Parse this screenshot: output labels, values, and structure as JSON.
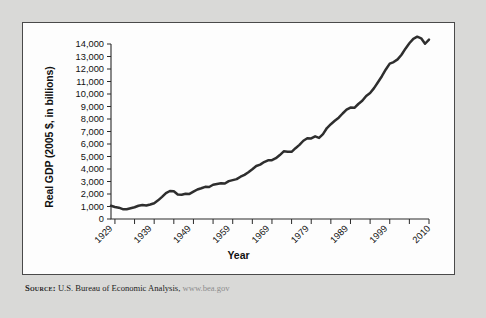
{
  "figure": {
    "source_prefix": "Source:",
    "source_text": "U.S. Bureau of Economic Analysis,",
    "source_url": "www.bea.gov"
  },
  "chart_data": {
    "type": "line",
    "title": "",
    "xlabel": "Year",
    "ylabel": "Real GDP (2005 $, in billions)",
    "xlim": [
      1929,
      2010
    ],
    "ylim": [
      0,
      14000
    ],
    "grid": false,
    "legend": "none",
    "x_tick_interval": 5,
    "x_labeled_ticks": [
      "1929",
      "1939",
      "1949",
      "1959",
      "1969",
      "1979",
      "1989",
      "1999",
      "2010"
    ],
    "y_tick_labels": [
      "0",
      "1,000",
      "2,000",
      "3,000",
      "4,000",
      "5,000",
      "6,000",
      "7,000",
      "8,000",
      "9,000",
      "10,000",
      "11,000",
      "12,000",
      "13,000",
      "14,000"
    ],
    "y_tick_values": [
      0,
      1000,
      2000,
      3000,
      4000,
      5000,
      6000,
      7000,
      8000,
      9000,
      10000,
      11000,
      12000,
      13000,
      14000
    ],
    "line_color": "#2e2e2e",
    "series": [
      {
        "name": "Real GDP (2005 $, in billions)",
        "x": [
          1929,
          1930,
          1931,
          1932,
          1933,
          1934,
          1935,
          1936,
          1937,
          1938,
          1939,
          1940,
          1941,
          1942,
          1943,
          1944,
          1945,
          1946,
          1947,
          1948,
          1949,
          1950,
          1951,
          1952,
          1953,
          1954,
          1955,
          1956,
          1957,
          1958,
          1959,
          1960,
          1961,
          1962,
          1963,
          1964,
          1965,
          1966,
          1967,
          1968,
          1969,
          1970,
          1971,
          1972,
          1973,
          1974,
          1975,
          1976,
          1977,
          1978,
          1979,
          1980,
          1981,
          1982,
          1983,
          1984,
          1985,
          1986,
          1987,
          1988,
          1989,
          1990,
          1991,
          1992,
          1993,
          1994,
          1995,
          1996,
          1997,
          1998,
          1999,
          2000,
          2001,
          2002,
          2003,
          2004,
          2005,
          2006,
          2007,
          2008,
          2009,
          2010
        ],
        "values": [
          1057,
          966,
          904,
          787,
          777,
          861,
          938,
          1059,
          1114,
          1075,
          1163,
          1264,
          1491,
          1772,
          2074,
          2240,
          2218,
          1961,
          1940,
          2020,
          2009,
          2184,
          2361,
          2457,
          2572,
          2557,
          2739,
          2797,
          2856,
          2835,
          3031,
          3109,
          3189,
          3384,
          3532,
          3735,
          3977,
          4236,
          4348,
          4555,
          4697,
          4706,
          4861,
          5117,
          5412,
          5382,
          5372,
          5665,
          5929,
          6261,
          6459,
          6444,
          6610,
          6490,
          6786,
          7277,
          7586,
          7854,
          8103,
          8440,
          8746,
          8911,
          8892,
          9201,
          9454,
          9842,
          10084,
          10469,
          10939,
          11421,
          11964,
          12434,
          12554,
          12772,
          13142,
          13629,
          14059,
          14416,
          14585,
          14453,
          14020,
          14348
        ]
      }
    ]
  }
}
